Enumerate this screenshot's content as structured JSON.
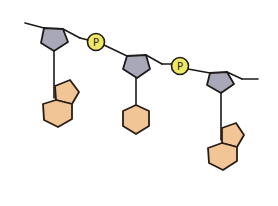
{
  "diagram": {
    "title": "",
    "colors": {
      "sugar": "#a9a8b8",
      "base": "#f1c596",
      "phosphate": "#efe765",
      "outline": "#1e1a1a"
    },
    "phosphates": [
      {
        "label": "P"
      },
      {
        "label": "P"
      }
    ],
    "nucleotides": [
      {
        "sugar": "pentagon",
        "base_type": "purine (double ring)"
      },
      {
        "sugar": "pentagon",
        "base_type": "pyrimidine (single ring)"
      },
      {
        "sugar": "pentagon",
        "base_type": "purine (double ring)"
      }
    ]
  }
}
